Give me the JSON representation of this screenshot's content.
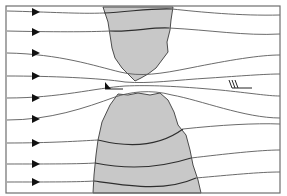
{
  "diagram": {
    "type": "streamline-flow-through-gap",
    "colors": {
      "background": "#ffffff",
      "land": "#c8c8c8",
      "streamline": "#5a5a5a",
      "frame": "#6e6e6e",
      "arrow": "#111111"
    },
    "flow_direction": "left-to-right",
    "streamline_count": 9,
    "arrows_y": [
      12,
      32,
      53,
      76,
      98,
      119,
      143,
      164,
      182
    ],
    "land_masses": [
      {
        "name": "upper-land",
        "position": "top-center"
      },
      {
        "name": "lower-land",
        "position": "bottom-center"
      }
    ],
    "wind_barbs": [
      {
        "name": "gap-barb",
        "position": "left of gap",
        "symbol": "pennant (strong wind)"
      },
      {
        "name": "downstream-barb",
        "position": "right side",
        "symbol": "three full barbs"
      }
    ]
  }
}
